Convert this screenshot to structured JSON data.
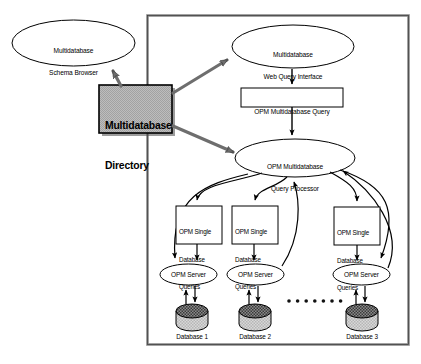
{
  "diagram": {
    "title_present": false,
    "background_color": "#ffffff",
    "stroke_color": "#000000",
    "directory_fill": "#b3b3b3",
    "frame": {
      "name": "system-boundary",
      "x": 147,
      "y": 15,
      "width": 262,
      "height": 330,
      "border_color": "#777777"
    },
    "nodes": {
      "schema_browser": {
        "shape": "ellipse",
        "lines": [
          "Multidatabase",
          "Schema Browser"
        ],
        "x": 12,
        "y": 20,
        "width": 123,
        "height": 46
      },
      "directory": {
        "shape": "rect",
        "lines": [
          "Multidatabase",
          "Directory"
        ],
        "x": 99,
        "y": 85,
        "width": 73,
        "height": 48,
        "fill": "#b3b3b3"
      },
      "web_query_interface": {
        "shape": "ellipse",
        "lines": [
          "Multidatabase",
          "Web Query Interface"
        ],
        "x": 232,
        "y": 25,
        "width": 122,
        "height": 43
      },
      "multidatabase_query": {
        "shape": "rect",
        "lines": [
          "OPM Multidatabase Query"
        ],
        "x": 241,
        "y": 88,
        "width": 102,
        "height": 19
      },
      "query_processor": {
        "shape": "ellipse",
        "lines": [
          "OPM Multidatabase",
          "Query Processor"
        ],
        "x": 235,
        "y": 139,
        "width": 120,
        "height": 38
      }
    },
    "columns": [
      {
        "id": "col-1",
        "queries_box": {
          "lines": [
            "OPM Single",
            "Database",
            "Queries"
          ],
          "x": 176,
          "y": 206,
          "width": 46,
          "height": 38
        },
        "server": {
          "label": "OPM Server",
          "x": 160,
          "y": 264,
          "width": 57,
          "height": 21
        },
        "database": {
          "label": "Database 1",
          "cx": 192,
          "cy": 318,
          "rx": 16,
          "ry": 13
        }
      },
      {
        "id": "col-2",
        "queries_box": {
          "lines": [
            "OPM Single",
            "Database",
            "Queries"
          ],
          "x": 232,
          "y": 206,
          "width": 46,
          "height": 38
        },
        "server": {
          "label": "OPM Server",
          "x": 227,
          "y": 264,
          "width": 57,
          "height": 21
        },
        "database": {
          "label": "Database 2",
          "cx": 255,
          "cy": 318,
          "rx": 16,
          "ry": 13
        }
      },
      {
        "id": "col-3",
        "queries_box": {
          "lines": [
            "OPM Single",
            "Database",
            "Queries"
          ],
          "x": 334,
          "y": 207,
          "width": 46,
          "height": 38
        },
        "server": {
          "label": "OPM Server",
          "x": 333,
          "y": 264,
          "width": 57,
          "height": 21
        },
        "database": {
          "label": "Database 3",
          "cx": 362,
          "cy": 318,
          "rx": 16,
          "ry": 13
        }
      }
    ],
    "ellipsis": {
      "name": "more-databases-ellipsis",
      "count": 7,
      "x_start": 288,
      "y": 301,
      "spacing": 8.6,
      "radius": 1.7
    }
  }
}
